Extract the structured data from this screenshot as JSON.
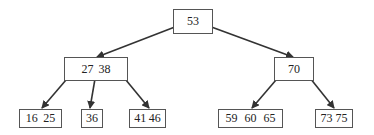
{
  "diagram": {
    "type": "b-tree",
    "root": {
      "id": "n53",
      "keys": [
        "53"
      ]
    },
    "level1": [
      {
        "id": "n27_38",
        "keys": [
          "27",
          "38"
        ]
      },
      {
        "id": "n70",
        "keys": [
          "70"
        ]
      }
    ],
    "leaves": [
      {
        "id": "n16_25",
        "keys": [
          "16",
          "25"
        ]
      },
      {
        "id": "n36",
        "keys": [
          "36"
        ]
      },
      {
        "id": "n41_46",
        "keys": [
          "41",
          "46"
        ]
      },
      {
        "id": "n59_60_65",
        "keys": [
          "59",
          "60",
          "65"
        ]
      },
      {
        "id": "n73_75",
        "keys": [
          "73",
          "75"
        ]
      }
    ],
    "edges": [
      {
        "from": "53",
        "to": "27 38"
      },
      {
        "from": "53",
        "to": "70"
      },
      {
        "from": "27 38",
        "to": "16 25"
      },
      {
        "from": "27 38",
        "to": "36"
      },
      {
        "from": "27 38",
        "to": "41 46"
      },
      {
        "from": "70",
        "to": "59 60 65"
      },
      {
        "from": "70",
        "to": "73 75"
      }
    ],
    "colors": {
      "stroke": "#333333",
      "box_border": "#555555",
      "text": "#222222"
    }
  }
}
